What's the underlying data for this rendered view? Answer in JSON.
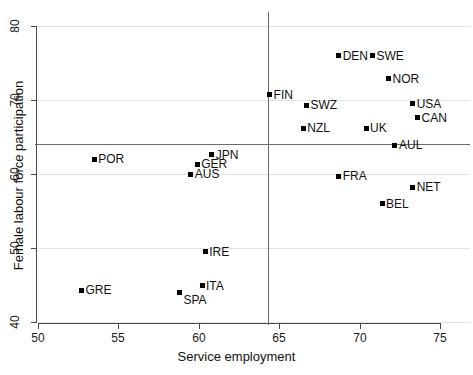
{
  "chart_data": {
    "type": "scatter",
    "title": "",
    "xlabel": "Service employment",
    "ylabel": "Female labour force participation",
    "xlim": [
      50,
      75
    ],
    "ylim": [
      40,
      80
    ],
    "xticks": [
      50,
      55,
      60,
      65,
      70,
      75
    ],
    "yticks": [
      40,
      50,
      60,
      70,
      80
    ],
    "grid": true,
    "legend": "none",
    "reference_lines": {
      "vertical_x": 64.3,
      "horizontal_y": 64.0
    },
    "points": [
      {
        "label": "GRE",
        "x": 52.7,
        "y": 44.3,
        "label_side": "right"
      },
      {
        "label": "POR",
        "x": 53.5,
        "y": 62.0,
        "label_side": "right"
      },
      {
        "label": "SPA",
        "x": 58.8,
        "y": 44.0,
        "label_side": "right-below"
      },
      {
        "label": "AUS",
        "x": 59.5,
        "y": 60.0,
        "label_side": "right"
      },
      {
        "label": "GER",
        "x": 59.9,
        "y": 61.3,
        "label_side": "right"
      },
      {
        "label": "ITA",
        "x": 60.2,
        "y": 44.9,
        "label_side": "right"
      },
      {
        "label": "IRE",
        "x": 60.4,
        "y": 49.5,
        "label_side": "right"
      },
      {
        "label": "JPN",
        "x": 60.8,
        "y": 62.6,
        "label_side": "right"
      },
      {
        "label": "FIN",
        "x": 64.4,
        "y": 70.7,
        "label_side": "right"
      },
      {
        "label": "NZL",
        "x": 66.5,
        "y": 66.2,
        "label_side": "right"
      },
      {
        "label": "SWZ",
        "x": 66.7,
        "y": 69.3,
        "label_side": "right"
      },
      {
        "label": "FRA",
        "x": 68.7,
        "y": 59.7,
        "label_side": "right"
      },
      {
        "label": "DEN",
        "x": 68.7,
        "y": 76.0,
        "label_side": "right"
      },
      {
        "label": "UK",
        "x": 70.4,
        "y": 66.2,
        "label_side": "right"
      },
      {
        "label": "SWE",
        "x": 70.8,
        "y": 76.0,
        "label_side": "right"
      },
      {
        "label": "BEL",
        "x": 71.4,
        "y": 56.0,
        "label_side": "right"
      },
      {
        "label": "NOR",
        "x": 71.8,
        "y": 72.9,
        "label_side": "right"
      },
      {
        "label": "AUL",
        "x": 72.2,
        "y": 63.9,
        "label_side": "right"
      },
      {
        "label": "NET",
        "x": 73.3,
        "y": 58.2,
        "label_side": "right"
      },
      {
        "label": "USA",
        "x": 73.3,
        "y": 69.5,
        "label_side": "right"
      },
      {
        "label": "CAN",
        "x": 73.6,
        "y": 67.6,
        "label_side": "right"
      }
    ]
  }
}
